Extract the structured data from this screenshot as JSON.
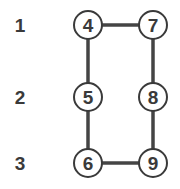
{
  "rows": [
    {
      "label": "1"
    },
    {
      "label": "2"
    },
    {
      "label": "3"
    }
  ],
  "nodes": [
    {
      "id": "4",
      "label": "4",
      "row": 0,
      "col": 0
    },
    {
      "id": "7",
      "label": "7",
      "row": 0,
      "col": 1
    },
    {
      "id": "5",
      "label": "5",
      "row": 1,
      "col": 0
    },
    {
      "id": "8",
      "label": "8",
      "row": 1,
      "col": 1
    },
    {
      "id": "6",
      "label": "6",
      "row": 2,
      "col": 0
    },
    {
      "id": "9",
      "label": "9",
      "row": 2,
      "col": 1
    }
  ],
  "edges": [
    {
      "from": "4",
      "to": "7"
    },
    {
      "from": "4",
      "to": "5"
    },
    {
      "from": "5",
      "to": "6"
    },
    {
      "from": "7",
      "to": "8"
    },
    {
      "from": "8",
      "to": "9"
    },
    {
      "from": "6",
      "to": "9"
    }
  ]
}
